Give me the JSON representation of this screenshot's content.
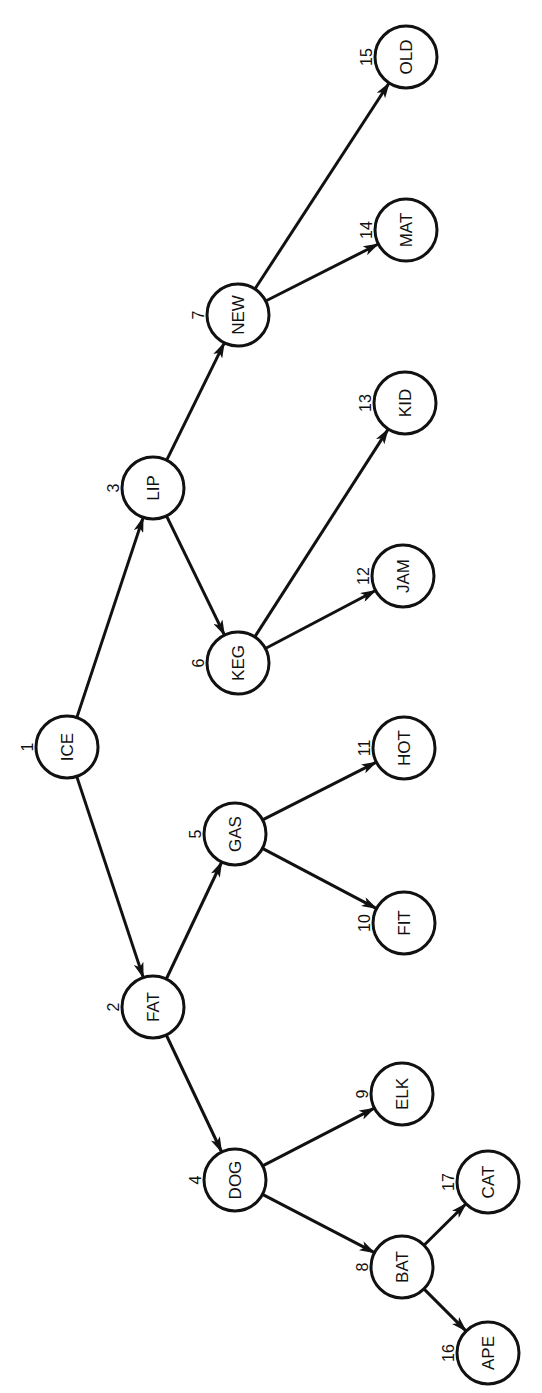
{
  "diagram": {
    "type": "binary search tree",
    "orientation": "rotated 90 degrees counter-clockwise",
    "colors": {
      "stroke": "#111111",
      "background": "#ffffff"
    },
    "node_radius": 31,
    "nodes": [
      {
        "id": 1,
        "label": "ICE",
        "x": 67,
        "y": 747
      },
      {
        "id": 2,
        "label": "FAT",
        "x": 153,
        "y": 1007
      },
      {
        "id": 3,
        "label": "LIP",
        "x": 153,
        "y": 488
      },
      {
        "id": 4,
        "label": "DOG",
        "x": 235,
        "y": 1180
      },
      {
        "id": 5,
        "label": "GAS",
        "x": 235,
        "y": 834
      },
      {
        "id": 6,
        "label": "KEG",
        "x": 238,
        "y": 663
      },
      {
        "id": 7,
        "label": "NEW",
        "x": 238,
        "y": 315
      },
      {
        "id": 8,
        "label": "BAT",
        "x": 402,
        "y": 1267
      },
      {
        "id": 9,
        "label": "ELK",
        "x": 402,
        "y": 1094
      },
      {
        "id": 10,
        "label": "FIT",
        "x": 404,
        "y": 923
      },
      {
        "id": 11,
        "label": "HOT",
        "x": 404,
        "y": 748
      },
      {
        "id": 12,
        "label": "JAM",
        "x": 403,
        "y": 576
      },
      {
        "id": 13,
        "label": "KID",
        "x": 405,
        "y": 403
      },
      {
        "id": 14,
        "label": "MAT",
        "x": 406,
        "y": 230
      },
      {
        "id": 15,
        "label": "OLD",
        "x": 406,
        "y": 57
      },
      {
        "id": 16,
        "label": "APE",
        "x": 488,
        "y": 1353
      },
      {
        "id": 17,
        "label": "CAT",
        "x": 488,
        "y": 1182
      }
    ],
    "edges": [
      {
        "from": 1,
        "to": 2
      },
      {
        "from": 1,
        "to": 3
      },
      {
        "from": 2,
        "to": 4
      },
      {
        "from": 2,
        "to": 5
      },
      {
        "from": 3,
        "to": 6
      },
      {
        "from": 3,
        "to": 7
      },
      {
        "from": 4,
        "to": 8
      },
      {
        "from": 4,
        "to": 9
      },
      {
        "from": 5,
        "to": 10
      },
      {
        "from": 5,
        "to": 11
      },
      {
        "from": 6,
        "to": 12
      },
      {
        "from": 6,
        "to": 13
      },
      {
        "from": 7,
        "to": 14
      },
      {
        "from": 7,
        "to": 15
      },
      {
        "from": 8,
        "to": 16
      },
      {
        "from": 8,
        "to": 17
      }
    ]
  }
}
